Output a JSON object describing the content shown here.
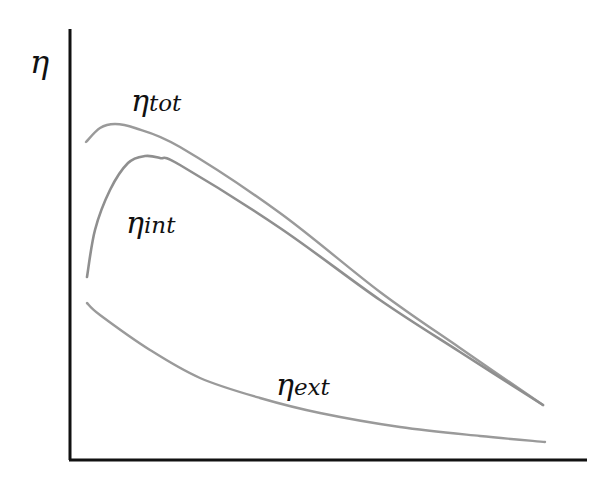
{
  "chart_data": {
    "type": "line",
    "title": "",
    "xlabel": "",
    "ylabel": "η",
    "grid": false,
    "ticks": false,
    "legend": "inline labels on curves",
    "colors": {
      "axis": "#111111",
      "curves": "#9a9a9a",
      "text": "#111111"
    },
    "series": [
      {
        "name": "η_tot",
        "label_main": "η",
        "label_sub": "tot",
        "shape": "rises quickly to early maximum then decreases roughly linearly",
        "points_px": [
          [
            86,
            142
          ],
          [
            100,
            128
          ],
          [
            115,
            124
          ],
          [
            135,
            128
          ],
          [
            180,
            147
          ],
          [
            280,
            213
          ],
          [
            380,
            292
          ],
          [
            460,
            348
          ],
          [
            543,
            405
          ]
        ]
      },
      {
        "name": "η_int",
        "label_main": "η",
        "label_sub": "int",
        "shape": "starts low, rises steeply to maximum, then decreases roughly linearly converging with η_tot",
        "points_px": [
          [
            87,
            277
          ],
          [
            95,
            230
          ],
          [
            110,
            190
          ],
          [
            128,
            163
          ],
          [
            145,
            156
          ],
          [
            160,
            158
          ],
          [
            180,
            165
          ],
          [
            280,
            228
          ],
          [
            380,
            300
          ],
          [
            460,
            352
          ],
          [
            543,
            405
          ]
        ]
      },
      {
        "name": "η_ext",
        "label_main": "η",
        "label_sub": "ext",
        "shape": "monotonically decreasing, convex decay",
        "points_px": [
          [
            87,
            303
          ],
          [
            100,
            315
          ],
          [
            150,
            350
          ],
          [
            200,
            378
          ],
          [
            260,
            398
          ],
          [
            320,
            413
          ],
          [
            400,
            427
          ],
          [
            480,
            436
          ],
          [
            545,
            442
          ]
        ]
      }
    ],
    "axes_px": {
      "origin": [
        70,
        460
      ],
      "y_top": [
        70,
        29
      ],
      "x_end": [
        587,
        460
      ]
    }
  },
  "labels": {
    "y_axis": "η",
    "tot_main": "η",
    "tot_sub": "tot",
    "int_main": "η",
    "int_sub": "int",
    "ext_main": "η",
    "ext_sub": "ext"
  }
}
